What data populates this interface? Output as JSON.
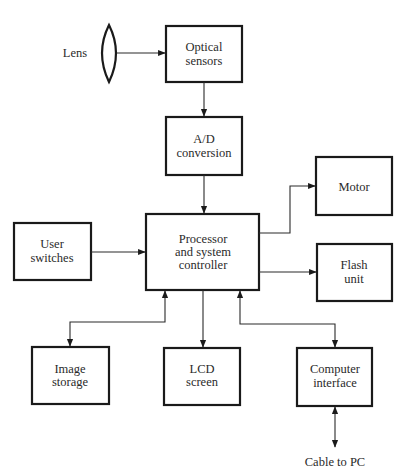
{
  "diagram": {
    "type": "block-diagram",
    "lens": {
      "label": "Lens"
    },
    "blocks": {
      "optical_sensors": {
        "line1": "Optical",
        "line2": "sensors"
      },
      "ad_conversion": {
        "line1": "A/D",
        "line2": "conversion"
      },
      "processor": {
        "line1": "Processor",
        "line2": "and system",
        "line3": "controller"
      },
      "user_switches": {
        "line1": "User",
        "line2": "switches"
      },
      "motor": {
        "line1": "Motor"
      },
      "flash_unit": {
        "line1": "Flash",
        "line2": "unit"
      },
      "image_storage": {
        "line1": "Image",
        "line2": "storage"
      },
      "lcd_screen": {
        "line1": "LCD",
        "line2": "screen"
      },
      "computer_interface": {
        "line1": "Computer",
        "line2": "interface"
      }
    },
    "external": {
      "cable_label": "Cable to PC"
    },
    "connections": [
      {
        "from": "Lens",
        "to": "Optical sensors",
        "direction": "one-way"
      },
      {
        "from": "Optical sensors",
        "to": "A/D conversion",
        "direction": "one-way"
      },
      {
        "from": "A/D conversion",
        "to": "Processor and system controller",
        "direction": "one-way"
      },
      {
        "from": "User switches",
        "to": "Processor and system controller",
        "direction": "one-way"
      },
      {
        "from": "Processor and system controller",
        "to": "Motor",
        "direction": "one-way"
      },
      {
        "from": "Processor and system controller",
        "to": "Flash unit",
        "direction": "one-way"
      },
      {
        "from": "Processor and system controller",
        "to": "Image storage",
        "direction": "two-way"
      },
      {
        "from": "Processor and system controller",
        "to": "LCD screen",
        "direction": "one-way"
      },
      {
        "from": "Processor and system controller",
        "to": "Computer interface",
        "direction": "two-way"
      },
      {
        "from": "Computer interface",
        "to": "Cable to PC",
        "direction": "two-way"
      }
    ]
  }
}
